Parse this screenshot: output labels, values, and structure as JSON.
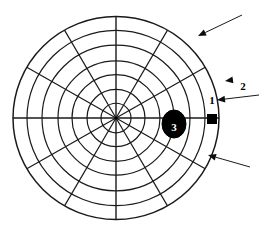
{
  "figure": {
    "background_color": "#ffffff",
    "line_color": "#1a1a1a",
    "marker_color": "#000000",
    "center": {
      "x": 116,
      "y": 118
    },
    "outer_radius": 103,
    "ring_count": 7,
    "ring_radii": [
      15,
      29,
      44,
      58,
      74,
      89,
      103
    ],
    "spoke_count": 12,
    "spoke_angles_deg": [
      0,
      30,
      60,
      90,
      120,
      150,
      180,
      210,
      240,
      270,
      300,
      330
    ]
  },
  "markers": [
    {
      "id": "marker-1",
      "label": "1",
      "shape": "square",
      "fill": "#000000",
      "x": 212,
      "y": 119,
      "size": 9,
      "label_x": 212,
      "label_y": 104
    },
    {
      "id": "marker-3",
      "label": "3",
      "shape": "ellipse",
      "fill": "#000000",
      "text_color": "#ffffff",
      "cx": 174,
      "cy": 124,
      "rx": 12,
      "ry": 14
    }
  ],
  "callouts": [
    {
      "id": "callout-2",
      "label": "2",
      "label_x": 243,
      "label_y": 90,
      "arrow_from": {
        "x": 259,
        "y": 95
      },
      "arrow_to": {
        "x": 217,
        "y": 100
      }
    },
    {
      "id": "callout-top",
      "label": "",
      "arrow_from": {
        "x": 242,
        "y": 15
      },
      "arrow_to": {
        "x": 198,
        "y": 36
      }
    },
    {
      "id": "callout-bottom",
      "label": "",
      "arrow_from": {
        "x": 250,
        "y": 167
      },
      "arrow_to": {
        "x": 208,
        "y": 155
      }
    },
    {
      "id": "callout-small-tick",
      "label": "",
      "arrow_from": {
        "x": 232,
        "y": 80
      },
      "arrow_to": {
        "x": 225,
        "y": 81
      }
    }
  ]
}
